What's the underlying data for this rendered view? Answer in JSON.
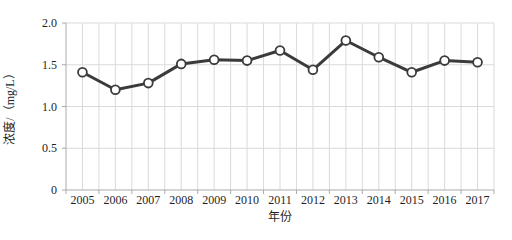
{
  "chart_data": {
    "type": "line",
    "title": "",
    "xlabel": "年份",
    "ylabel": "浓度/（mg/L）",
    "x": [
      2005,
      2006,
      2007,
      2008,
      2009,
      2010,
      2011,
      2012,
      2013,
      2014,
      2015,
      2016,
      2017
    ],
    "series": [
      {
        "name": "浓度",
        "values": [
          1.41,
          1.2,
          1.28,
          1.51,
          1.56,
          1.55,
          1.67,
          1.44,
          1.79,
          1.59,
          1.41,
          1.55,
          1.53
        ]
      }
    ],
    "ylim": [
      0,
      2.0
    ],
    "ytick_interval": 0.5,
    "ytick_labels": [
      "0",
      "0.5",
      "1.0",
      "1.5",
      "2.0"
    ],
    "grid": "on",
    "minor_x_gridlines_per_category": 2,
    "legend_position": "none",
    "marker": "open-circle",
    "colors": {
      "series_line": "#3b3b3b",
      "marker_fill": "#ffffff",
      "marker_stroke": "#3b3b3b",
      "gridline": "#dadada",
      "axis_line": "#ababab",
      "text": "#1f1f1f",
      "background": "#ffffff"
    }
  }
}
